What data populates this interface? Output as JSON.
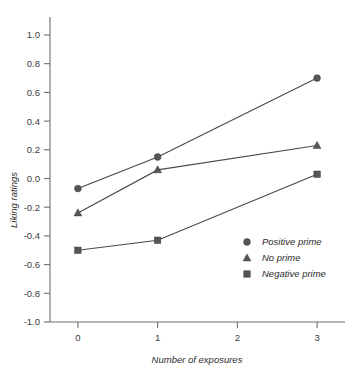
{
  "chart_data": {
    "type": "line",
    "title": "",
    "xlabel": "Number of exposures",
    "ylabel": "Liking ratings",
    "x": [
      0,
      1,
      3
    ],
    "xticks": [
      0,
      1,
      2,
      3
    ],
    "xticklabels": [
      "0",
      "1",
      "2",
      "3"
    ],
    "xlim": [
      -0.35,
      3.35
    ],
    "yticks": [
      1.0,
      0.8,
      0.6,
      0.4,
      0.2,
      0.0,
      -0.2,
      -0.4,
      -0.6,
      -0.8,
      -1.0
    ],
    "yticklabels": [
      "1.0",
      "0.8",
      "0.6",
      "0.4",
      "0.2",
      "0.0",
      "-0.2",
      "-0.4",
      "-0.6",
      "-0.8",
      "-1.0"
    ],
    "ylim": [
      -1.0,
      1.0
    ],
    "grid": false,
    "legend_position": "lower-right-inside",
    "series": [
      {
        "name": "Positive prime",
        "marker": "circle",
        "color": "#555555",
        "values": [
          -0.07,
          0.15,
          0.7
        ]
      },
      {
        "name": "No prime",
        "marker": "triangle",
        "color": "#555555",
        "values": [
          -0.24,
          0.06,
          0.23
        ]
      },
      {
        "name": "Negative prime",
        "marker": "square",
        "color": "#555555",
        "values": [
          -0.5,
          -0.43,
          0.03
        ]
      }
    ]
  },
  "legend": {
    "items": [
      {
        "label": "Positive prime",
        "marker": "circle-marker-icon"
      },
      {
        "label": "No prime",
        "marker": "triangle-marker-icon"
      },
      {
        "label": "Negative prime",
        "marker": "square-marker-icon"
      }
    ]
  },
  "axis": {
    "y_title": "Liking ratings",
    "x_title": "Number of exposures"
  },
  "colors": {
    "marker": "#555555",
    "line": "#4a4a4a",
    "axis": "#6e6e6e",
    "text": "#2b2b2b",
    "background": "#ffffff"
  }
}
